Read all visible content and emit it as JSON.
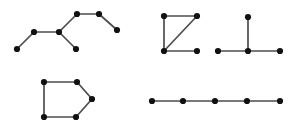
{
  "canvas": {
    "width": 300,
    "height": 129,
    "background_color": "#ffffff",
    "node_color": "#111111",
    "edge_color": "#4d4d4d",
    "node_radius": 3.1,
    "edge_width": 1.7
  },
  "chart_data": {
    "type": "diagram",
    "diagram_type": "node-link-graph",
    "title": "",
    "xlabel": "",
    "ylabel": "",
    "grid": false,
    "legend": false,
    "graph_count": 5,
    "total_nodes": 25,
    "total_edges": 20,
    "graphs": [
      {
        "id": "graph-top-left",
        "name": "zigzag-tree",
        "node_count": 7,
        "edge_count": 6,
        "shape": "tree",
        "nodes": [
          {
            "id": 0,
            "x": 17,
            "y": 49
          },
          {
            "id": 1,
            "x": 34,
            "y": 32
          },
          {
            "id": 2,
            "x": 59,
            "y": 32
          },
          {
            "id": 3,
            "x": 76,
            "y": 49
          },
          {
            "id": 4,
            "x": 77,
            "y": 14
          },
          {
            "id": 5,
            "x": 99,
            "y": 14
          },
          {
            "id": 6,
            "x": 117,
            "y": 30
          }
        ],
        "edges": [
          [
            0,
            1
          ],
          [
            1,
            2
          ],
          [
            2,
            3
          ],
          [
            2,
            4
          ],
          [
            4,
            5
          ],
          [
            5,
            6
          ]
        ]
      },
      {
        "id": "graph-top-middle",
        "name": "square-with-diagonal",
        "node_count": 4,
        "edge_count": 4,
        "shape": "Z-square",
        "nodes": [
          {
            "id": 0,
            "x": 164,
            "y": 16
          },
          {
            "id": 1,
            "x": 197,
            "y": 16
          },
          {
            "id": 2,
            "x": 164,
            "y": 51
          },
          {
            "id": 3,
            "x": 197,
            "y": 51
          }
        ],
        "edges": [
          [
            0,
            1
          ],
          [
            0,
            2
          ],
          [
            1,
            2
          ],
          [
            2,
            3
          ]
        ]
      },
      {
        "id": "graph-top-right",
        "name": "t-shape",
        "node_count": 4,
        "edge_count": 3,
        "shape": "T",
        "nodes": [
          {
            "id": 0,
            "x": 248,
            "y": 17
          },
          {
            "id": 1,
            "x": 248,
            "y": 51
          },
          {
            "id": 2,
            "x": 218,
            "y": 51
          },
          {
            "id": 3,
            "x": 280,
            "y": 51
          }
        ],
        "edges": [
          [
            0,
            1
          ],
          [
            1,
            2
          ],
          [
            1,
            3
          ]
        ]
      },
      {
        "id": "graph-bottom-left",
        "name": "pentagon-house",
        "node_count": 5,
        "edge_count": 5,
        "shape": "pentagon",
        "nodes": [
          {
            "id": 0,
            "x": 44,
            "y": 82
          },
          {
            "id": 1,
            "x": 77,
            "y": 82
          },
          {
            "id": 2,
            "x": 92,
            "y": 99
          },
          {
            "id": 3,
            "x": 76,
            "y": 117
          },
          {
            "id": 4,
            "x": 44,
            "y": 117
          }
        ],
        "edges": [
          [
            0,
            1
          ],
          [
            1,
            2
          ],
          [
            2,
            3
          ],
          [
            3,
            4
          ],
          [
            4,
            0
          ]
        ]
      },
      {
        "id": "graph-bottom-right",
        "name": "horizontal-path",
        "node_count": 5,
        "edge_count": 4,
        "shape": "path",
        "nodes": [
          {
            "id": 0,
            "x": 152,
            "y": 101
          },
          {
            "id": 1,
            "x": 183,
            "y": 101
          },
          {
            "id": 2,
            "x": 215,
            "y": 101
          },
          {
            "id": 3,
            "x": 247,
            "y": 101
          },
          {
            "id": 4,
            "x": 280,
            "y": 101
          }
        ],
        "edges": [
          [
            0,
            1
          ],
          [
            1,
            2
          ],
          [
            2,
            3
          ],
          [
            3,
            4
          ]
        ]
      }
    ]
  }
}
